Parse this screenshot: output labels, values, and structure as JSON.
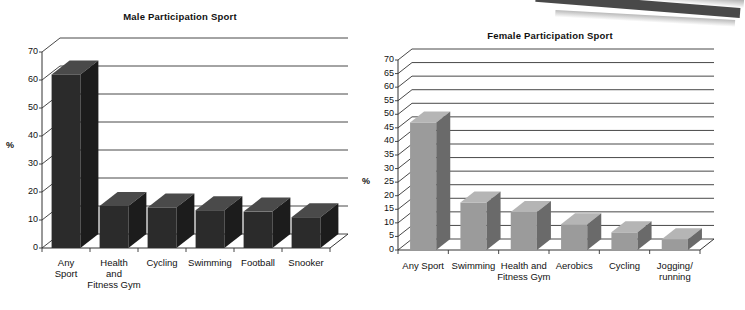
{
  "figure": {
    "background_color": "#ffffff",
    "artifact": "scanned-page-edge-top-right"
  },
  "charts": [
    {
      "id": "male-participation-sport",
      "title": "Male Participation Sport",
      "ylabel": "%",
      "tick_labels": [
        "0",
        "10",
        "20",
        "30",
        "40",
        "50",
        "60",
        "70"
      ],
      "categories": [
        "Any\nSport",
        "Health\nand\nFitness Gym",
        "Cycling",
        "Swimming",
        "Football",
        "Snooker"
      ],
      "bar_face_color": "#2b2b2b",
      "bar_top_color": "#4a4a4a",
      "bar_side_color": "#1c1c1c"
    },
    {
      "id": "female-participation-sport",
      "title": "Female Participation Sport",
      "ylabel": "%",
      "tick_labels": [
        "0",
        "5",
        "10",
        "15",
        "20",
        "25",
        "30",
        "35",
        "40",
        "45",
        "50",
        "55",
        "60",
        "65",
        "70"
      ],
      "categories": [
        "Any Sport",
        "Swimming",
        "Health and\nFitness Gym",
        "Aerobics",
        "Cycling",
        "Jogging/\nrunning"
      ],
      "bar_face_color": "#9b9b9b",
      "bar_top_color": "#b5b5b5",
      "bar_side_color": "#6a6a6a"
    }
  ],
  "chart_data": [
    {
      "type": "bar",
      "title": "Male Participation Sport",
      "xlabel": "",
      "ylabel": "%",
      "ylim": [
        0,
        70
      ],
      "ytick_step": 10,
      "grid": true,
      "legend": "none",
      "categories": [
        "Any Sport",
        "Health and Fitness Gym",
        "Cycling",
        "Swimming",
        "Football",
        "Snooker"
      ],
      "values": [
        62,
        15,
        14.5,
        13.5,
        13,
        11
      ],
      "series": [
        {
          "name": "Male participation",
          "values": [
            62,
            15,
            14.5,
            13.5,
            13,
            11
          ]
        }
      ]
    },
    {
      "type": "bar",
      "title": "Female Participation Sport",
      "xlabel": "",
      "ylabel": "%",
      "ylim": [
        0,
        70
      ],
      "ytick_step": 5,
      "grid": true,
      "legend": "none",
      "categories": [
        "Any Sport",
        "Swimming",
        "Health and Fitness Gym",
        "Aerobics",
        "Cycling",
        "Jogging/running"
      ],
      "values": [
        47,
        17.5,
        14,
        9.5,
        6.5,
        4
      ],
      "series": [
        {
          "name": "Female participation",
          "values": [
            47,
            17.5,
            14,
            9.5,
            6.5,
            4
          ]
        }
      ]
    }
  ]
}
